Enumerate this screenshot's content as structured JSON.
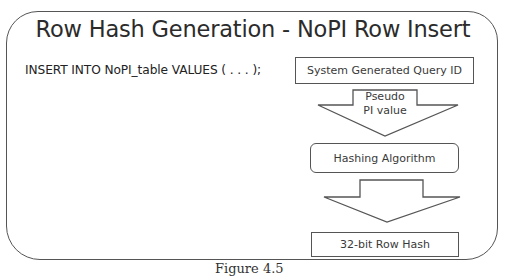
{
  "diagram": {
    "title": "Row Hash Generation - NoPI Row Insert",
    "sql_statement": "INSERT INTO NoPI_table VALUES ( . . . );",
    "steps": [
      {
        "label": "System Generated Query ID",
        "shape": "rectangle"
      },
      {
        "label": "Hashing Algorithm",
        "shape": "rounded-rectangle"
      },
      {
        "label": "32-bit Row Hash",
        "shape": "rectangle"
      }
    ],
    "arrows": [
      {
        "label_line1": "Pseudo",
        "label_line2": "PI value",
        "direction": "down"
      },
      {
        "label_line1": "",
        "label_line2": "",
        "direction": "down"
      }
    ],
    "caption": "Figure 4.5",
    "colors": {
      "stroke": "#555555",
      "text": "#2b2b2b",
      "background": "#ffffff"
    }
  }
}
